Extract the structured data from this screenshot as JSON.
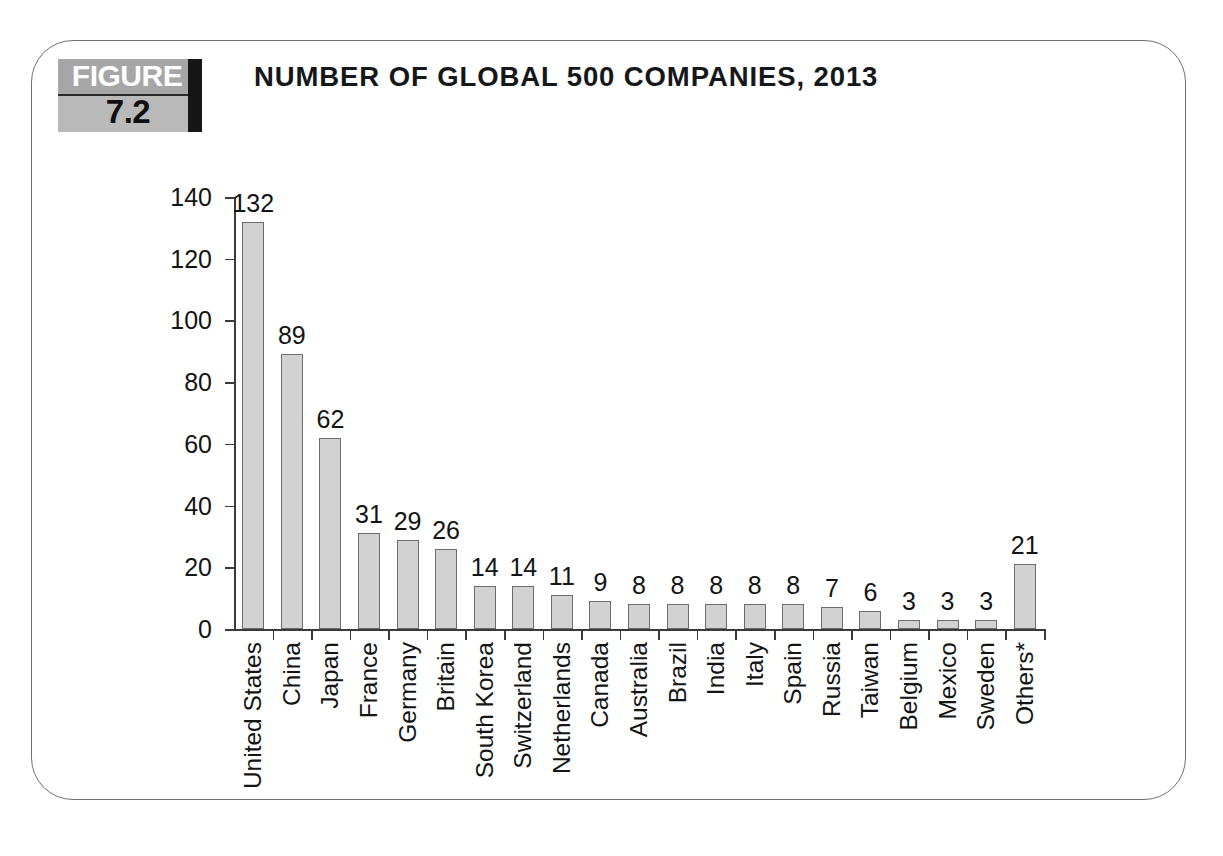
{
  "page_artifact": "",
  "figure": {
    "badge_word": "FIGURE",
    "badge_number": "7.2",
    "title": "NUMBER OF GLOBAL 500 COMPANIES, 2013"
  },
  "chart_data": {
    "type": "bar",
    "title": "NUMBER OF GLOBAL 500 COMPANIES, 2013",
    "xlabel": "",
    "ylabel": "",
    "ylim": [
      0,
      140
    ],
    "yticks": [
      0,
      20,
      40,
      60,
      80,
      100,
      120,
      140
    ],
    "grid": false,
    "legend": null,
    "bar_color": "#d2d2d2",
    "bar_border_color": "#6d6d6d",
    "value_labels_shown": true,
    "categories": [
      "United States",
      "China",
      "Japan",
      "France",
      "Germany",
      "Britain",
      "South Korea",
      "Switzerland",
      "Netherlands",
      "Canada",
      "Australia",
      "Brazil",
      "India",
      "Italy",
      "Spain",
      "Russia",
      "Taiwan",
      "Belgium",
      "Mexico",
      "Sweden",
      "Others*"
    ],
    "values": [
      132,
      89,
      62,
      31,
      29,
      26,
      14,
      14,
      11,
      9,
      8,
      8,
      8,
      8,
      8,
      7,
      6,
      3,
      3,
      3,
      21
    ]
  }
}
